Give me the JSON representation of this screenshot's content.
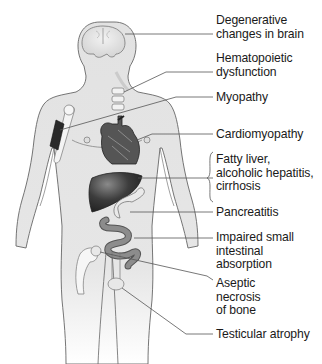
{
  "diagram": {
    "type": "anatomical-body-diagram",
    "labels": [
      {
        "id": "brain",
        "text": "Degenerative\nchanges in brain",
        "organ": "brain"
      },
      {
        "id": "hematopoietic",
        "text": "Hematopoietic\ndysfunction",
        "organ": "vertebrae / bone marrow"
      },
      {
        "id": "myopathy",
        "text": "Myopathy",
        "organ": "arm muscle"
      },
      {
        "id": "cardiomyopathy",
        "text": "Cardiomyopathy",
        "organ": "heart"
      },
      {
        "id": "liver",
        "text": "Fatty liver,\nalcoholic hepatitis,\ncirrhosis",
        "organ": "liver"
      },
      {
        "id": "pancreatitis",
        "text": "Pancreatitis",
        "organ": "pancreas"
      },
      {
        "id": "intestine",
        "text": "Impaired small\nintestinal\nabsorption",
        "organ": "small intestine"
      },
      {
        "id": "bone",
        "text": "Aseptic\nnecrosis\nof bone",
        "organ": "femoral head"
      },
      {
        "id": "testes",
        "text": "Testicular atrophy",
        "organ": "testes"
      }
    ],
    "colors": {
      "body_fill": "#e4e4e4",
      "outline": "#5a5a5a",
      "liver": "#3a3a3a",
      "heart": "#4a4a4a",
      "intestine": "#8a8a8a",
      "bone": "#f4f4f4",
      "leader_line": "#555555",
      "text": "#1a1a1a"
    }
  }
}
